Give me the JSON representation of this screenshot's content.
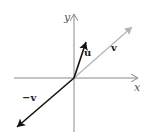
{
  "diagram": {
    "type": "vector-diagram",
    "origin": [
      74,
      78
    ],
    "axes": {
      "x": {
        "label": "x",
        "from": [
          14,
          78
        ],
        "to": [
          138,
          78
        ],
        "color": "#8a8a8a"
      },
      "y": {
        "label": "y",
        "from": [
          74,
          132
        ],
        "to": [
          74,
          14
        ],
        "color": "#8a8a8a"
      }
    },
    "vectors": [
      {
        "id": "v",
        "label": "v",
        "to": [
          132,
          27
        ],
        "color": "#b5b5b5",
        "label_pos": [
          111,
          51
        ]
      },
      {
        "id": "u",
        "label": "u",
        "to": [
          86,
          42
        ],
        "color": "#111111",
        "label_pos": [
          84,
          56
        ]
      },
      {
        "id": "neg-v",
        "label": "−v",
        "to": [
          17,
          127
        ],
        "color": "#111111",
        "label_pos": [
          22,
          101
        ]
      }
    ]
  }
}
